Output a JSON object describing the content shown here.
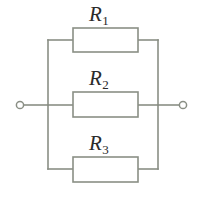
{
  "diagram": {
    "type": "electrical-schematic",
    "colors": {
      "line": "#8a8f85",
      "label": "#2b2b2b",
      "background": "#ffffff"
    },
    "terminals": [
      {
        "name": "left-terminal",
        "cx": 20,
        "cy": 105,
        "r": 3.6
      },
      {
        "name": "right-terminal",
        "cx": 183,
        "cy": 105,
        "r": 3.6
      }
    ],
    "buses": {
      "left_x": 48,
      "right_x": 158,
      "top_y": 40,
      "bottom_y": 169,
      "mid_y": 105
    },
    "branches": [
      {
        "name": "branch-r1",
        "label": "R",
        "subscript": "1",
        "box": {
          "x": 73,
          "y": 28,
          "width": 65,
          "height": 24
        },
        "wire_y": 40
      },
      {
        "name": "branch-r2",
        "label": "R",
        "subscript": "2",
        "box": {
          "x": 73,
          "y": 92,
          "width": 65,
          "height": 25
        },
        "wire_y": 105
      },
      {
        "name": "branch-r3",
        "label": "R",
        "subscript": "3",
        "box": {
          "x": 73,
          "y": 157,
          "width": 65,
          "height": 25
        },
        "wire_y": 169
      }
    ]
  }
}
